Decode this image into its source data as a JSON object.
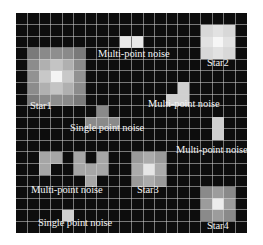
{
  "diagram": {
    "grid": {
      "cols": 20,
      "rows": 19,
      "cell_w": 11.55,
      "cell_h": 11.58,
      "background": "#0d0d0d",
      "line_color": "#d2d2d2"
    },
    "labels": [
      {
        "id": "star1",
        "text": "Star1",
        "x": 30,
        "y": 101
      },
      {
        "id": "multi-noise-top",
        "text": "Multi-point noise",
        "x": 98,
        "y": 49
      },
      {
        "id": "star2",
        "text": "Star2",
        "x": 207,
        "y": 58
      },
      {
        "id": "multi-noise-mid",
        "text": "Multi-point noise",
        "x": 148,
        "y": 99
      },
      {
        "id": "single-noise-mid",
        "text": "Single point noise",
        "x": 70,
        "y": 123
      },
      {
        "id": "multi-noise-right",
        "text": "Multi-point noise",
        "x": 176,
        "y": 145
      },
      {
        "id": "multi-noise-bottom",
        "text": "Multi-point noise",
        "x": 31,
        "y": 185
      },
      {
        "id": "star3",
        "text": "Star3",
        "x": 137,
        "y": 185
      },
      {
        "id": "single-noise-bottom",
        "text": "Single point noise",
        "x": 38,
        "y": 218
      },
      {
        "id": "star4",
        "text": "Star4",
        "x": 207,
        "y": 221
      }
    ],
    "cells": [
      {
        "c": 1,
        "r": 3,
        "v": "#7a7a7a"
      },
      {
        "c": 2,
        "r": 3,
        "v": "#8a8a8a"
      },
      {
        "c": 3,
        "r": 3,
        "v": "#8e8e8e"
      },
      {
        "c": 4,
        "r": 3,
        "v": "#8a8a8a"
      },
      {
        "c": 5,
        "r": 3,
        "v": "#7a7a7a"
      },
      {
        "c": 1,
        "r": 4,
        "v": "#8c8c8c"
      },
      {
        "c": 2,
        "r": 4,
        "v": "#b0b0b0"
      },
      {
        "c": 3,
        "r": 4,
        "v": "#c4c4c4"
      },
      {
        "c": 4,
        "r": 4,
        "v": "#b0b0b0"
      },
      {
        "c": 5,
        "r": 4,
        "v": "#8c8c8c"
      },
      {
        "c": 1,
        "r": 5,
        "v": "#929292"
      },
      {
        "c": 2,
        "r": 5,
        "v": "#c8c8c8"
      },
      {
        "c": 3,
        "r": 5,
        "v": "#f4f4f4"
      },
      {
        "c": 4,
        "r": 5,
        "v": "#c8c8c8"
      },
      {
        "c": 5,
        "r": 5,
        "v": "#929292"
      },
      {
        "c": 1,
        "r": 6,
        "v": "#8c8c8c"
      },
      {
        "c": 2,
        "r": 6,
        "v": "#b0b0b0"
      },
      {
        "c": 3,
        "r": 6,
        "v": "#c4c4c4"
      },
      {
        "c": 4,
        "r": 6,
        "v": "#b0b0b0"
      },
      {
        "c": 5,
        "r": 6,
        "v": "#8c8c8c"
      },
      {
        "c": 1,
        "r": 7,
        "v": "#7a7a7a"
      },
      {
        "c": 2,
        "r": 7,
        "v": "#8a8a8a"
      },
      {
        "c": 3,
        "r": 7,
        "v": "#8e8e8e"
      },
      {
        "c": 4,
        "r": 7,
        "v": "#8a8a8a"
      },
      {
        "c": 5,
        "r": 7,
        "v": "#7a7a7a"
      },
      {
        "c": 9,
        "r": 2,
        "v": "#e8e8e8"
      },
      {
        "c": 10,
        "r": 2,
        "v": "#e8e8e8"
      },
      {
        "c": 16,
        "r": 1,
        "v": "#d8d8d8"
      },
      {
        "c": 17,
        "r": 1,
        "v": "#e2e2e2"
      },
      {
        "c": 18,
        "r": 1,
        "v": "#d8d8d8"
      },
      {
        "c": 16,
        "r": 2,
        "v": "#e2e2e2"
      },
      {
        "c": 17,
        "r": 2,
        "v": "#f6f6f6"
      },
      {
        "c": 18,
        "r": 2,
        "v": "#e2e2e2"
      },
      {
        "c": 16,
        "r": 3,
        "v": "#d8d8d8"
      },
      {
        "c": 17,
        "r": 3,
        "v": "#e2e2e2"
      },
      {
        "c": 18,
        "r": 3,
        "v": "#d8d8d8"
      },
      {
        "c": 14,
        "r": 6,
        "v": "#d0d0d0"
      },
      {
        "c": 13,
        "r": 7,
        "v": "#d0d0d0"
      },
      {
        "c": 14,
        "r": 7,
        "v": "#d0d0d0"
      },
      {
        "c": 7,
        "r": 8,
        "v": "#8a8a8a"
      },
      {
        "c": 6,
        "r": 9,
        "v": "#8a8a8a"
      },
      {
        "c": 7,
        "r": 9,
        "v": "#8a8a8a"
      },
      {
        "c": 8,
        "r": 9,
        "v": "#8a8a8a"
      },
      {
        "c": 17,
        "r": 9,
        "v": "#cfcfcf"
      },
      {
        "c": 17,
        "r": 10,
        "v": "#cfcfcf"
      },
      {
        "c": 2,
        "r": 12,
        "v": "#a6a6a6"
      },
      {
        "c": 3,
        "r": 12,
        "v": "#a6a6a6"
      },
      {
        "c": 5,
        "r": 12,
        "v": "#a6a6a6"
      },
      {
        "c": 7,
        "r": 12,
        "v": "#a6a6a6"
      },
      {
        "c": 2,
        "r": 13,
        "v": "#a6a6a6"
      },
      {
        "c": 5,
        "r": 13,
        "v": "#a6a6a6"
      },
      {
        "c": 6,
        "r": 13,
        "v": "#a6a6a6"
      },
      {
        "c": 7,
        "r": 13,
        "v": "#a6a6a6"
      },
      {
        "c": 6,
        "r": 14,
        "v": "#a6a6a6"
      },
      {
        "c": 10,
        "r": 12,
        "v": "#9a9a9a"
      },
      {
        "c": 11,
        "r": 12,
        "v": "#ababab"
      },
      {
        "c": 12,
        "r": 12,
        "v": "#9a9a9a"
      },
      {
        "c": 10,
        "r": 13,
        "v": "#ababab"
      },
      {
        "c": 11,
        "r": 13,
        "v": "#e6e6e6"
      },
      {
        "c": 12,
        "r": 13,
        "v": "#ababab"
      },
      {
        "c": 10,
        "r": 14,
        "v": "#9a9a9a"
      },
      {
        "c": 11,
        "r": 14,
        "v": "#ababab"
      },
      {
        "c": 12,
        "r": 14,
        "v": "#9a9a9a"
      },
      {
        "c": 4,
        "r": 17,
        "v": "#cfcfcf"
      },
      {
        "c": 16,
        "r": 15,
        "v": "#8a8a8a"
      },
      {
        "c": 17,
        "r": 15,
        "v": "#9c9c9c"
      },
      {
        "c": 18,
        "r": 15,
        "v": "#8a8a8a"
      },
      {
        "c": 16,
        "r": 16,
        "v": "#9c9c9c"
      },
      {
        "c": 17,
        "r": 16,
        "v": "#ececec"
      },
      {
        "c": 18,
        "r": 16,
        "v": "#9c9c9c"
      },
      {
        "c": 16,
        "r": 17,
        "v": "#8a8a8a"
      },
      {
        "c": 17,
        "r": 17,
        "v": "#9c9c9c"
      },
      {
        "c": 18,
        "r": 17,
        "v": "#8a8a8a"
      }
    ]
  }
}
